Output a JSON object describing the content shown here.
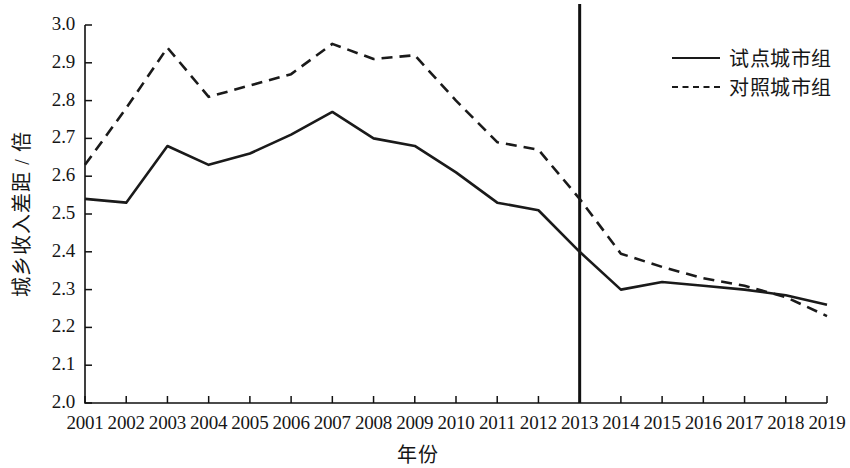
{
  "chart_data": {
    "type": "line",
    "title": "",
    "xlabel": "年份",
    "ylabel": "城乡收入差距 / 倍",
    "x": [
      2001,
      2002,
      2003,
      2004,
      2005,
      2006,
      2007,
      2008,
      2009,
      2010,
      2011,
      2012,
      2013,
      2014,
      2015,
      2016,
      2017,
      2018,
      2019
    ],
    "xticklabels": [
      "2001",
      "2002",
      "2003",
      "2004",
      "2005",
      "2006",
      "2007",
      "2008",
      "2009",
      "2010",
      "2011",
      "2012",
      "2013",
      "2014",
      "2015",
      "2016",
      "2017",
      "2018",
      "2019"
    ],
    "yticklabels": [
      "3.0",
      "2.9",
      "2.8",
      "2.7",
      "2.6",
      "2.5",
      "2.4",
      "2.3",
      "2.2",
      "2.1",
      "2.0"
    ],
    "ytickvalues": [
      3.0,
      2.9,
      2.8,
      2.7,
      2.6,
      2.5,
      2.4,
      2.3,
      2.2,
      2.1,
      2.0
    ],
    "ylim": [
      2.0,
      3.0
    ],
    "xlim": [
      2001,
      2019
    ],
    "grid": false,
    "legend_position": "top-right",
    "series": [
      {
        "name": "试点城市组",
        "style": "solid",
        "color": "#1a1a1a",
        "values": [
          2.54,
          2.53,
          2.68,
          2.63,
          2.66,
          2.71,
          2.77,
          2.7,
          2.68,
          2.61,
          2.53,
          2.51,
          2.4,
          2.3,
          2.32,
          2.31,
          2.3,
          2.285,
          2.26
        ]
      },
      {
        "name": "对照城市组",
        "style": "dashed",
        "color": "#1a1a1a",
        "values": [
          2.63,
          2.78,
          2.94,
          2.81,
          2.84,
          2.87,
          2.95,
          2.91,
          2.92,
          2.8,
          2.69,
          2.67,
          2.54,
          2.395,
          2.36,
          2.33,
          2.31,
          2.28,
          2.23
        ]
      }
    ],
    "annotations": [
      {
        "type": "vertical-line",
        "x": 2013,
        "label": ""
      }
    ]
  },
  "legend": {
    "items": [
      {
        "label": "试点城市组",
        "style": "solid"
      },
      {
        "label": "对照城市组",
        "style": "dashed"
      }
    ]
  },
  "axes": {
    "y_title": "城乡收入差距 / 倍",
    "x_title": "年份"
  }
}
